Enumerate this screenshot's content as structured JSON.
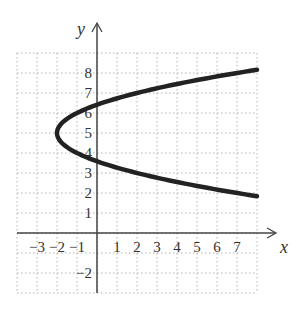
{
  "chart_data": {
    "type": "line",
    "title": "",
    "xlabel": "x",
    "ylabel": "y",
    "xlim": [
      -4,
      8
    ],
    "ylim": [
      -3,
      9
    ],
    "grid": true,
    "grid_style": "dotted",
    "x_ticks": [
      "-3",
      "-2",
      "-1",
      "1",
      "2",
      "3",
      "4",
      "5",
      "6",
      "7"
    ],
    "x_tick_values": [
      -3,
      -2,
      -1,
      1,
      2,
      3,
      4,
      5,
      6,
      7
    ],
    "y_ticks": [
      "8",
      "7",
      "6",
      "5",
      "4",
      "3",
      "2",
      "1",
      "-2"
    ],
    "y_tick_values": [
      8,
      7,
      6,
      5,
      4,
      3,
      2,
      1,
      -2
    ],
    "series": [
      {
        "name": "parabola x = (y-5)^2 - 2",
        "description": "Horizontal parabola opening right with vertex at (-2, 5)",
        "vertex": [
          -2,
          5
        ],
        "points": [
          [
            8,
            8.16
          ],
          [
            7,
            8
          ],
          [
            4,
            7.45
          ],
          [
            2,
            7
          ],
          [
            0,
            6.41
          ],
          [
            -1,
            6
          ],
          [
            -2,
            5
          ],
          [
            -1,
            4
          ],
          [
            0,
            3.59
          ],
          [
            2,
            3
          ],
          [
            4,
            2.55
          ],
          [
            7,
            2
          ],
          [
            8,
            1.84
          ]
        ],
        "color": "#222222"
      }
    ],
    "legend": null
  },
  "colors": {
    "curve": "#222222",
    "axis": "#444444",
    "grid": "#b0b0b0",
    "text": "#333333"
  }
}
